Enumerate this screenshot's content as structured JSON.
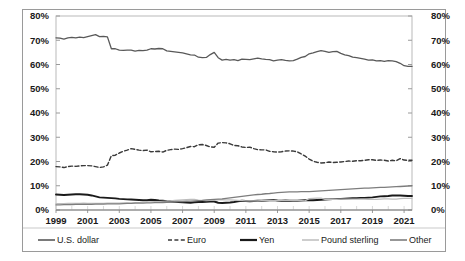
{
  "chart_data": {
    "type": "line",
    "title": "",
    "subtitle": "",
    "xlabel": "",
    "ylabel": "",
    "ylim": [
      0,
      80
    ],
    "xlim": [
      1999,
      2021
    ],
    "grid": false,
    "legend_position": "bottom",
    "y_ticks": [
      "0%",
      "10%",
      "20%",
      "30%",
      "40%",
      "50%",
      "60%",
      "70%",
      "80%"
    ],
    "y_tick_values": [
      0,
      10,
      20,
      30,
      40,
      50,
      60,
      70,
      80
    ],
    "y_axis_right_ticks": [
      "0%",
      "10%",
      "20%",
      "30%",
      "40%",
      "50%",
      "60%",
      "70%",
      "80%"
    ],
    "x_ticks": [
      "1999",
      "2001",
      "2003",
      "2005",
      "2007",
      "2009",
      "2011",
      "2013",
      "2015",
      "2017",
      "2019",
      "2021"
    ],
    "x": [
      1999,
      1999.25,
      1999.5,
      1999.75,
      2000,
      2000.25,
      2000.5,
      2000.75,
      2001,
      2001.25,
      2001.5,
      2001.75,
      2002,
      2002.25,
      2002.5,
      2002.75,
      2003,
      2003.25,
      2003.5,
      2003.75,
      2004,
      2004.25,
      2004.5,
      2004.75,
      2005,
      2005.25,
      2005.5,
      2005.75,
      2006,
      2006.25,
      2006.5,
      2006.75,
      2007,
      2007.25,
      2007.5,
      2007.75,
      2008,
      2008.25,
      2008.5,
      2008.75,
      2009,
      2009.25,
      2009.5,
      2009.75,
      2010,
      2010.25,
      2010.5,
      2010.75,
      2011,
      2011.25,
      2011.5,
      2011.75,
      2012,
      2012.25,
      2012.5,
      2012.75,
      2013,
      2013.25,
      2013.5,
      2013.75,
      2014,
      2014.25,
      2014.5,
      2014.75,
      2015,
      2015.25,
      2015.5,
      2015.75,
      2016,
      2016.25,
      2016.5,
      2016.75,
      2017,
      2017.25,
      2017.5,
      2017.75,
      2018,
      2018.25,
      2018.5,
      2018.75,
      2019,
      2019.25,
      2019.5,
      2019.75,
      2020,
      2020.25,
      2020.5,
      2020.75,
      2021,
      2021.25,
      2021.5
    ],
    "series": [
      {
        "name": "U.S. dollar",
        "color": "#595959",
        "style": "solid",
        "width": 1.3,
        "values": [
          71.0,
          70.9,
          70.5,
          71.0,
          71.2,
          71.0,
          71.3,
          71.1,
          71.5,
          71.9,
          72.3,
          71.5,
          71.6,
          71.4,
          66.5,
          66.5,
          65.9,
          65.8,
          65.9,
          65.9,
          65.5,
          65.8,
          65.7,
          65.9,
          66.5,
          66.4,
          66.6,
          66.5,
          65.6,
          65.4,
          65.2,
          65.0,
          64.8,
          64.4,
          64.0,
          63.9,
          63.0,
          62.8,
          62.9,
          64.1,
          65.0,
          62.8,
          61.8,
          62.1,
          61.8,
          62.0,
          61.6,
          62.2,
          62.1,
          62.0,
          62.3,
          62.6,
          62.3,
          62.1,
          62.0,
          61.5,
          61.8,
          62.0,
          61.7,
          61.5,
          61.6,
          62.2,
          62.9,
          63.3,
          64.4,
          64.8,
          65.3,
          65.7,
          65.4,
          65.0,
          65.3,
          65.4,
          64.6,
          64.0,
          63.7,
          63.0,
          62.8,
          62.5,
          62.2,
          61.8,
          61.9,
          61.5,
          61.6,
          61.3,
          61.6,
          61.5,
          61.2,
          60.5,
          59.5,
          59.2,
          59.2
        ]
      },
      {
        "name": "Euro",
        "color": "#3a3a3a",
        "style": "dashed",
        "width": 1.4,
        "values": [
          17.9,
          17.8,
          17.5,
          17.9,
          18.1,
          18.0,
          18.2,
          18.3,
          18.3,
          18.2,
          17.9,
          17.5,
          17.8,
          18.5,
          22.4,
          22.6,
          23.5,
          24.2,
          24.7,
          25.3,
          25.0,
          24.7,
          24.5,
          24.7,
          24.0,
          24.1,
          24.2,
          23.9,
          24.6,
          24.9,
          25.1,
          25.0,
          25.3,
          25.7,
          26.2,
          26.1,
          26.9,
          27.0,
          26.6,
          26.0,
          25.9,
          27.6,
          27.8,
          27.7,
          27.3,
          26.6,
          26.5,
          26.0,
          25.8,
          25.9,
          25.3,
          24.9,
          24.8,
          24.8,
          24.2,
          24.0,
          23.9,
          24.0,
          24.3,
          24.4,
          24.3,
          24.0,
          23.1,
          22.2,
          21.0,
          20.1,
          19.7,
          19.4,
          19.5,
          19.8,
          19.6,
          19.7,
          19.8,
          20.0,
          20.2,
          20.1,
          20.3,
          20.3,
          20.5,
          20.7,
          20.7,
          20.5,
          20.6,
          20.5,
          20.2,
          20.5,
          20.3,
          21.2,
          20.6,
          20.5,
          20.5
        ]
      },
      {
        "name": "Yen",
        "color": "#1a1a1a",
        "style": "solid",
        "width": 1.9,
        "values": [
          6.4,
          6.3,
          6.2,
          6.3,
          6.4,
          6.5,
          6.5,
          6.4,
          6.3,
          6.0,
          5.6,
          5.2,
          5.1,
          5.0,
          4.9,
          4.8,
          4.6,
          4.5,
          4.4,
          4.3,
          4.2,
          4.1,
          4.0,
          4.0,
          4.2,
          4.1,
          3.9,
          3.8,
          3.6,
          3.5,
          3.4,
          3.3,
          3.2,
          3.1,
          3.0,
          3.2,
          3.3,
          3.3,
          3.4,
          3.5,
          3.5,
          3.0,
          2.9,
          3.0,
          3.1,
          3.3,
          3.6,
          3.8,
          3.7,
          3.6,
          3.7,
          3.8,
          3.8,
          3.9,
          4.0,
          4.1,
          3.9,
          3.8,
          3.9,
          3.8,
          3.8,
          3.8,
          3.9,
          4.0,
          4.0,
          4.0,
          4.1,
          4.2,
          4.3,
          4.4,
          4.5,
          4.5,
          4.6,
          4.7,
          4.8,
          4.9,
          4.9,
          5.0,
          5.0,
          5.1,
          5.2,
          5.4,
          5.6,
          5.7,
          5.8,
          6.0,
          6.0,
          6.0,
          5.9,
          5.8,
          5.8
        ]
      },
      {
        "name": "Pound sterling",
        "color": "#bdbdbd",
        "style": "solid",
        "width": 1.2,
        "values": [
          2.6,
          2.6,
          2.6,
          2.7,
          2.7,
          2.7,
          2.7,
          2.8,
          2.7,
          2.7,
          2.7,
          2.7,
          2.7,
          2.8,
          2.8,
          2.8,
          2.8,
          2.9,
          2.9,
          2.8,
          3.0,
          3.1,
          3.2,
          3.3,
          3.4,
          3.5,
          3.5,
          3.6,
          3.7,
          3.8,
          4.0,
          4.1,
          4.2,
          4.3,
          4.4,
          4.4,
          4.1,
          4.0,
          3.9,
          4.0,
          4.1,
          4.2,
          4.3,
          4.2,
          4.2,
          4.1,
          4.0,
          3.9,
          3.8,
          3.8,
          3.8,
          3.8,
          3.9,
          4.0,
          4.0,
          4.0,
          4.0,
          4.0,
          4.0,
          4.0,
          3.9,
          3.9,
          3.9,
          3.8,
          4.7,
          4.8,
          4.9,
          4.9,
          4.4,
          4.4,
          4.5,
          4.4,
          4.5,
          4.5,
          4.5,
          4.5,
          4.5,
          4.5,
          4.5,
          4.4,
          4.4,
          4.4,
          4.5,
          4.6,
          4.6,
          4.5,
          4.5,
          4.7,
          4.8,
          4.8,
          4.8
        ]
      },
      {
        "name": "Other",
        "color": "#7d7d7d",
        "style": "solid",
        "width": 1.3,
        "values": [
          2.1,
          2.1,
          2.2,
          2.2,
          2.2,
          2.3,
          2.3,
          2.3,
          2.3,
          2.3,
          2.4,
          2.4,
          2.4,
          2.5,
          2.5,
          2.5,
          2.5,
          2.6,
          2.7,
          2.7,
          2.8,
          2.8,
          2.8,
          2.9,
          2.9,
          3.0,
          3.0,
          3.1,
          3.2,
          3.3,
          3.4,
          3.5,
          3.5,
          3.6,
          3.7,
          3.8,
          3.9,
          4.0,
          4.2,
          4.3,
          4.4,
          4.5,
          4.6,
          4.8,
          5.0,
          5.2,
          5.4,
          5.6,
          5.8,
          6.0,
          6.2,
          6.4,
          6.5,
          6.7,
          6.8,
          7.0,
          7.2,
          7.3,
          7.4,
          7.5,
          7.5,
          7.5,
          7.6,
          7.6,
          7.6,
          7.7,
          7.8,
          7.9,
          8.0,
          8.1,
          8.2,
          8.3,
          8.4,
          8.5,
          8.6,
          8.7,
          8.8,
          8.9,
          9.0,
          9.0,
          9.1,
          9.2,
          9.3,
          9.3,
          9.4,
          9.5,
          9.6,
          9.7,
          9.8,
          9.9,
          10.0
        ]
      }
    ]
  },
  "legend": {
    "items": [
      {
        "label": "U.S. dollar",
        "swatch": "line-solid-gray"
      },
      {
        "label": "Euro",
        "swatch": "line-dashed-dark"
      },
      {
        "label": "Yen",
        "swatch": "line-solid-thick-black"
      },
      {
        "label": "Pound sterling",
        "swatch": "line-solid-lightgray"
      },
      {
        "label": "Other",
        "swatch": "line-solid-midgray"
      }
    ]
  }
}
